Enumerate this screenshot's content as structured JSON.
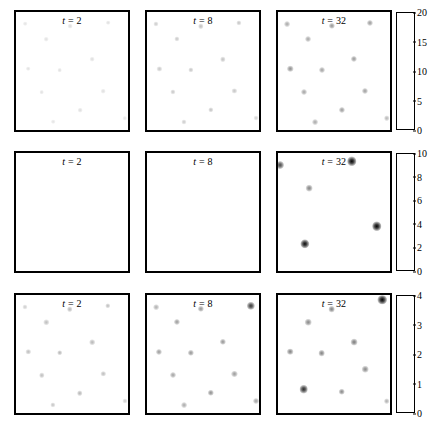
{
  "figure": {
    "title": "",
    "background_color": "#ffffff",
    "border_color": "#000000",
    "rows": 3,
    "columns": 3
  },
  "chart_data": {
    "type": "heatmap",
    "title": "",
    "xlabel": "",
    "ylabel": "",
    "grid": false,
    "legend_position": "right-colorbar-per-row",
    "colormap": "grayscale-white-to-black",
    "layout": "3 rows x 3 columns of spatial heatmap panels, one colorbar per row",
    "column_labels": [
      "t = 2",
      "t = 8",
      "t = 32"
    ],
    "time_values": [
      2,
      8,
      32
    ],
    "rows": [
      {
        "row_index": 0,
        "colorbar": {
          "vmin": 0,
          "vmax": 20,
          "ticks": [
            0,
            5,
            10,
            15,
            20
          ],
          "tick_labels": [
            "0",
            "5",
            "10",
            "15",
            "20"
          ]
        },
        "panels": [
          {
            "label": "t = 2",
            "t": 2,
            "points": [
              {
                "x": 0.08,
                "y": 0.1,
                "value": 1.2
              },
              {
                "x": 0.48,
                "y": 0.12,
                "value": 1.6
              },
              {
                "x": 0.82,
                "y": 0.09,
                "value": 1.4
              },
              {
                "x": 0.27,
                "y": 0.23,
                "value": 1.3
              },
              {
                "x": 0.68,
                "y": 0.4,
                "value": 1.5
              },
              {
                "x": 0.11,
                "y": 0.48,
                "value": 1.3
              },
              {
                "x": 0.39,
                "y": 0.49,
                "value": 1.4
              },
              {
                "x": 0.23,
                "y": 0.68,
                "value": 1.3
              },
              {
                "x": 0.78,
                "y": 0.67,
                "value": 1.4
              },
              {
                "x": 0.57,
                "y": 0.83,
                "value": 1.5
              },
              {
                "x": 0.33,
                "y": 0.93,
                "value": 1.2
              },
              {
                "x": 0.97,
                "y": 0.9,
                "value": 1.0
              }
            ]
          },
          {
            "label": "t = 8",
            "t": 8,
            "points": [
              {
                "x": 0.08,
                "y": 0.1,
                "value": 2.6
              },
              {
                "x": 0.48,
                "y": 0.12,
                "value": 3.4
              },
              {
                "x": 0.82,
                "y": 0.09,
                "value": 3.0
              },
              {
                "x": 0.27,
                "y": 0.23,
                "value": 2.8
              },
              {
                "x": 0.68,
                "y": 0.4,
                "value": 3.2
              },
              {
                "x": 0.11,
                "y": 0.48,
                "value": 2.8
              },
              {
                "x": 0.39,
                "y": 0.49,
                "value": 3.0
              },
              {
                "x": 0.23,
                "y": 0.68,
                "value": 2.8
              },
              {
                "x": 0.78,
                "y": 0.67,
                "value": 3.0
              },
              {
                "x": 0.57,
                "y": 0.83,
                "value": 3.2
              },
              {
                "x": 0.33,
                "y": 0.93,
                "value": 2.6
              },
              {
                "x": 0.97,
                "y": 0.9,
                "value": 2.2
              }
            ]
          },
          {
            "label": "t = 32",
            "t": 32,
            "points": [
              {
                "x": 0.08,
                "y": 0.1,
                "value": 5.0
              },
              {
                "x": 0.48,
                "y": 0.12,
                "value": 6.5
              },
              {
                "x": 0.82,
                "y": 0.09,
                "value": 6.0
              },
              {
                "x": 0.27,
                "y": 0.23,
                "value": 5.2
              },
              {
                "x": 0.68,
                "y": 0.4,
                "value": 6.2
              },
              {
                "x": 0.11,
                "y": 0.48,
                "value": 7.0
              },
              {
                "x": 0.39,
                "y": 0.49,
                "value": 5.6
              },
              {
                "x": 0.23,
                "y": 0.68,
                "value": 5.4
              },
              {
                "x": 0.78,
                "y": 0.67,
                "value": 5.8
              },
              {
                "x": 0.57,
                "y": 0.83,
                "value": 6.0
              },
              {
                "x": 0.33,
                "y": 0.93,
                "value": 5.0
              },
              {
                "x": 0.97,
                "y": 0.9,
                "value": 4.0
              }
            ]
          }
        ]
      },
      {
        "row_index": 1,
        "colorbar": {
          "vmin": 0,
          "vmax": 10,
          "ticks": [
            0,
            2,
            4,
            6,
            8,
            10
          ],
          "tick_labels": [
            "0",
            "2",
            "4",
            "6",
            "8",
            "10"
          ]
        },
        "panels": [
          {
            "label": "t = 2",
            "t": 2,
            "points": []
          },
          {
            "label": "t = 8",
            "t": 8,
            "points": []
          },
          {
            "label": "t = 32",
            "t": 32,
            "points": [
              {
                "x": 0.02,
                "y": 0.1,
                "value": 6.5
              },
              {
                "x": 0.66,
                "y": 0.07,
                "value": 9.8
              },
              {
                "x": 0.28,
                "y": 0.3,
                "value": 4.0
              },
              {
                "x": 0.88,
                "y": 0.62,
                "value": 10.0
              },
              {
                "x": 0.24,
                "y": 0.77,
                "value": 9.5
              }
            ]
          }
        ]
      },
      {
        "row_index": 2,
        "colorbar": {
          "vmin": 0,
          "vmax": 4,
          "ticks": [
            0,
            1,
            2,
            3,
            4
          ],
          "tick_labels": [
            "0",
            "1",
            "2",
            "3",
            "4"
          ]
        },
        "panels": [
          {
            "label": "t = 2",
            "t": 2,
            "points": [
              {
                "x": 0.08,
                "y": 0.1,
                "value": 0.5
              },
              {
                "x": 0.48,
                "y": 0.12,
                "value": 0.8
              },
              {
                "x": 0.82,
                "y": 0.09,
                "value": 0.7
              },
              {
                "x": 0.27,
                "y": 0.23,
                "value": 0.7
              },
              {
                "x": 0.68,
                "y": 0.4,
                "value": 0.8
              },
              {
                "x": 0.11,
                "y": 0.48,
                "value": 0.7
              },
              {
                "x": 0.39,
                "y": 0.49,
                "value": 0.8
              },
              {
                "x": 0.23,
                "y": 0.68,
                "value": 0.7
              },
              {
                "x": 0.78,
                "y": 0.67,
                "value": 0.7
              },
              {
                "x": 0.57,
                "y": 0.83,
                "value": 0.8
              },
              {
                "x": 0.33,
                "y": 0.93,
                "value": 0.6
              },
              {
                "x": 0.97,
                "y": 0.9,
                "value": 0.5
              }
            ]
          },
          {
            "label": "t = 8",
            "t": 8,
            "points": [
              {
                "x": 0.08,
                "y": 0.1,
                "value": 0.9
              },
              {
                "x": 0.48,
                "y": 0.12,
                "value": 1.3
              },
              {
                "x": 0.93,
                "y": 0.09,
                "value": 2.9
              },
              {
                "x": 0.27,
                "y": 0.23,
                "value": 1.2
              },
              {
                "x": 0.68,
                "y": 0.4,
                "value": 1.3
              },
              {
                "x": 0.11,
                "y": 0.48,
                "value": 1.2
              },
              {
                "x": 0.39,
                "y": 0.49,
                "value": 1.3
              },
              {
                "x": 0.23,
                "y": 0.68,
                "value": 1.1
              },
              {
                "x": 0.78,
                "y": 0.67,
                "value": 1.2
              },
              {
                "x": 0.57,
                "y": 0.83,
                "value": 1.4
              },
              {
                "x": 0.33,
                "y": 0.93,
                "value": 1.0
              },
              {
                "x": 0.97,
                "y": 0.9,
                "value": 1.1
              }
            ]
          },
          {
            "label": "t = 32",
            "t": 32,
            "points": [
              {
                "x": 0.48,
                "y": 0.12,
                "value": 1.6
              },
              {
                "x": 0.93,
                "y": 0.04,
                "value": 4.0
              },
              {
                "x": 0.27,
                "y": 0.23,
                "value": 1.5
              },
              {
                "x": 0.68,
                "y": 0.4,
                "value": 1.7
              },
              {
                "x": 0.11,
                "y": 0.48,
                "value": 1.6
              },
              {
                "x": 0.39,
                "y": 0.49,
                "value": 1.6
              },
              {
                "x": 0.78,
                "y": 0.63,
                "value": 1.5
              },
              {
                "x": 0.23,
                "y": 0.8,
                "value": 3.2
              },
              {
                "x": 0.57,
                "y": 0.82,
                "value": 1.5
              },
              {
                "x": 0.97,
                "y": 0.9,
                "value": 0.9
              }
            ]
          }
        ]
      }
    ]
  }
}
